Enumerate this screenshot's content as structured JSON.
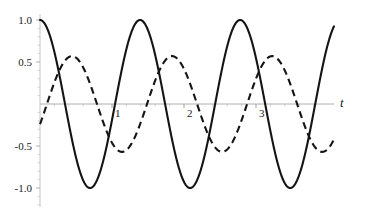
{
  "chart_data": {
    "type": "line",
    "title": "",
    "xlabel": "t",
    "ylabel": "",
    "xlim": [
      -0.05,
      4.1
    ],
    "ylim": [
      -1.12,
      1.12
    ],
    "grid": false,
    "legend": "none",
    "x_ticks": [
      {
        "value": 1,
        "label": "1"
      },
      {
        "value": 2,
        "label": "2"
      },
      {
        "value": 3,
        "label": "3"
      }
    ],
    "y_ticks": [
      {
        "value": 1.0,
        "label": "1.0"
      },
      {
        "value": 0.5,
        "label": "0.5"
      },
      {
        "value": -0.5,
        "label": "-0.5"
      },
      {
        "value": -1.0,
        "label": "-1.0"
      }
    ],
    "minor_tick_count_per_interval": 4,
    "series": [
      {
        "name": "solid-wave",
        "style": "solid",
        "color": "#141414",
        "amplitude": 1.0,
        "period": 1.39,
        "phase_deg": 0,
        "form": "cos",
        "notes": "starts at 1.0 at t=0, first minimum near t=0.67, peaks near t=1.33, 2.72, 4.1"
      },
      {
        "name": "dashed-wave",
        "style": "dashed",
        "color": "#141414",
        "amplitude": 0.57,
        "period": 1.39,
        "phase_deg": 115,
        "form": "cos",
        "notes": "starts near 0 at t=0, rises to peak ~0.57 near t=0.39, troughs ~-0.57 near t=1.08"
      }
    ]
  },
  "axes": {
    "x_axis_name": "t",
    "origin": {
      "x_px": 40,
      "y_px": 104
    },
    "x_unit_px": 72,
    "y_unit_px": 84
  }
}
